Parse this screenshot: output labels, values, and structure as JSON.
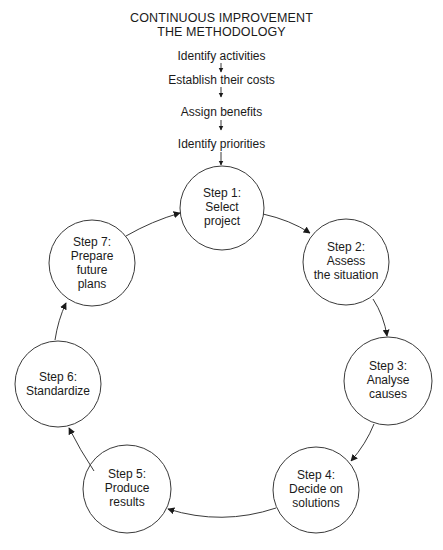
{
  "title": {
    "line1": "CONTINUOUS IMPROVEMENT",
    "line2": "THE METHODOLOGY"
  },
  "preliminary_steps": [
    "Identify activities",
    "Establish their costs",
    "Assign benefits",
    "Identify priorities"
  ],
  "cycle_steps": [
    {
      "step": "Step 1:",
      "lines": [
        "Select",
        "project"
      ]
    },
    {
      "step": "Step 2:",
      "lines": [
        "Assess",
        "the situation"
      ]
    },
    {
      "step": "Step 3:",
      "lines": [
        "Analyse",
        "causes"
      ]
    },
    {
      "step": "Step 4:",
      "lines": [
        "Decide on",
        "solutions"
      ]
    },
    {
      "step": "Step 5:",
      "lines": [
        "Produce",
        "results"
      ]
    },
    {
      "step": "Step 6:",
      "lines": [
        "Standardize"
      ]
    },
    {
      "step": "Step 7:",
      "lines": [
        "Prepare",
        "future",
        "plans"
      ]
    }
  ],
  "colors": {
    "stroke": "#3a3a3a",
    "text": "#1a1a1a",
    "background": "#ffffff"
  }
}
